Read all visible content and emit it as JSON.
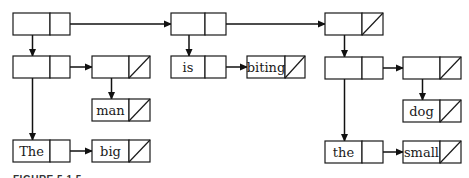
{
  "diagram": {
    "caption": "FIGURE 5.1.5",
    "colors": {
      "line": "#1a1a1a",
      "background": "#ffffff"
    },
    "nodes": [
      {
        "id": "A",
        "label": "",
        "x": 13,
        "y": 13,
        "w": 57,
        "split": 37,
        "nil": false
      },
      {
        "id": "B",
        "label": "",
        "x": 171,
        "y": 13,
        "w": 55,
        "split": 34,
        "nil": false
      },
      {
        "id": "C",
        "label": "",
        "x": 325,
        "y": 13,
        "w": 58,
        "split": 37,
        "nil": true
      },
      {
        "id": "D",
        "label": "",
        "x": 13,
        "y": 56,
        "w": 57,
        "split": 37,
        "nil": false
      },
      {
        "id": "E",
        "label": "",
        "x": 92,
        "y": 56,
        "w": 58,
        "split": 37,
        "nil": true
      },
      {
        "id": "is",
        "label": "is",
        "x": 171,
        "y": 56,
        "w": 55,
        "split": 34,
        "nil": false
      },
      {
        "id": "biting",
        "label": "biting",
        "x": 247,
        "y": 56,
        "w": 58,
        "split": 38,
        "nil": true
      },
      {
        "id": "F",
        "label": "",
        "x": 325,
        "y": 57,
        "w": 58,
        "split": 37,
        "nil": false
      },
      {
        "id": "G",
        "label": "",
        "x": 403,
        "y": 57,
        "w": 58,
        "split": 37,
        "nil": true
      },
      {
        "id": "man",
        "label": "man",
        "x": 92,
        "y": 99,
        "w": 58,
        "split": 37,
        "nil": true
      },
      {
        "id": "dog",
        "label": "dog",
        "x": 403,
        "y": 100,
        "w": 58,
        "split": 37,
        "nil": true
      },
      {
        "id": "The",
        "label": "The",
        "x": 13,
        "y": 140,
        "w": 57,
        "split": 37,
        "nil": false
      },
      {
        "id": "big",
        "label": "big",
        "x": 92,
        "y": 140,
        "w": 58,
        "split": 37,
        "nil": true
      },
      {
        "id": "the",
        "label": "the",
        "x": 325,
        "y": 141,
        "w": 58,
        "split": 37,
        "nil": false
      },
      {
        "id": "small",
        "label": "small",
        "x": 403,
        "y": 141,
        "w": 58,
        "split": 37,
        "nil": true
      }
    ],
    "node_height": 22,
    "edges": [
      {
        "from": "A",
        "to": "B",
        "kind": "cdr"
      },
      {
        "from": "B",
        "to": "C",
        "kind": "cdr"
      },
      {
        "from": "A",
        "to": "D",
        "kind": "car"
      },
      {
        "from": "B",
        "to": "is",
        "kind": "car"
      },
      {
        "from": "C",
        "to": "F",
        "kind": "car"
      },
      {
        "from": "D",
        "to": "E",
        "kind": "cdr"
      },
      {
        "from": "is",
        "to": "biting",
        "kind": "cdr"
      },
      {
        "from": "F",
        "to": "G",
        "kind": "cdr"
      },
      {
        "from": "D",
        "to": "The",
        "kind": "car"
      },
      {
        "from": "E",
        "to": "man",
        "kind": "car"
      },
      {
        "from": "F",
        "to": "the",
        "kind": "car"
      },
      {
        "from": "G",
        "to": "dog",
        "kind": "car"
      },
      {
        "from": "The",
        "to": "big",
        "kind": "cdr"
      },
      {
        "from": "the",
        "to": "small",
        "kind": "cdr"
      }
    ]
  }
}
